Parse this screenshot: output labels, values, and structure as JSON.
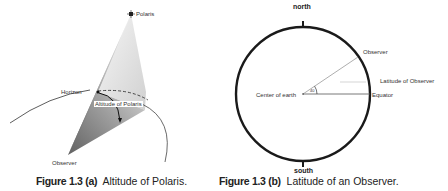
{
  "figure_a": {
    "labels": {
      "star": "Polaris",
      "horizon": "Horizon",
      "angle": "Altitude of Polaris",
      "observer": "Observer"
    },
    "caption": {
      "number": "Figure 1.3 (a)",
      "title": "Altitude of Polaris."
    }
  },
  "figure_b": {
    "labels": {
      "north": "north",
      "south": "south",
      "observer": "Observer",
      "latitude": "Latitude of Observer",
      "equator": "Equator",
      "center": "Center of earth",
      "angle_value": "40"
    },
    "caption": {
      "number": "Figure 1.3 (b)",
      "title": "Latitude of an Observer."
    }
  },
  "colors": {
    "outline": "#1a1a1a",
    "cone_dark": "#6e6e6e",
    "cone_light": "#e6e6e6"
  }
}
